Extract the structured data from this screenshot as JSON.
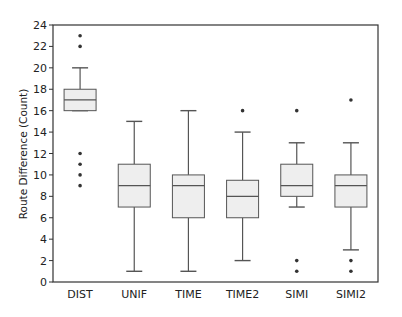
{
  "chart_data": {
    "type": "box",
    "title": "",
    "xlabel": "",
    "ylabel": "Route Difference (Count)",
    "ylim": [
      0,
      24
    ],
    "yticks": [
      0,
      2,
      4,
      6,
      8,
      10,
      12,
      14,
      16,
      18,
      20,
      22,
      24
    ],
    "grid": false,
    "legend": null,
    "categories": [
      "DIST",
      "UNIF",
      "TIME",
      "TIME2",
      "SIMI",
      "SIMI2"
    ],
    "boxes": [
      {
        "name": "DIST",
        "whisker_low": 16,
        "q1": 16,
        "median": 17,
        "q3": 18,
        "whisker_high": 20,
        "outliers": [
          23,
          22,
          12,
          11,
          10,
          9
        ]
      },
      {
        "name": "UNIF",
        "whisker_low": 1,
        "q1": 7,
        "median": 9,
        "q3": 11,
        "whisker_high": 15,
        "outliers": []
      },
      {
        "name": "TIME",
        "whisker_low": 1,
        "q1": 6,
        "median": 9,
        "q3": 10,
        "whisker_high": 16,
        "outliers": []
      },
      {
        "name": "TIME2",
        "whisker_low": 2,
        "q1": 6,
        "median": 8,
        "q3": 9.5,
        "whisker_high": 14,
        "outliers": [
          16
        ]
      },
      {
        "name": "SIMI",
        "whisker_low": 7,
        "q1": 8,
        "median": 9,
        "q3": 11,
        "whisker_high": 13,
        "outliers": [
          16,
          2,
          1
        ]
      },
      {
        "name": "SIMI2",
        "whisker_low": 3,
        "q1": 7,
        "median": 9,
        "q3": 10,
        "whisker_high": 13,
        "outliers": [
          17,
          2,
          1
        ]
      }
    ],
    "colors": {
      "box_fill": "#eeeeee",
      "box_edge": "#555555",
      "median": "#555555",
      "whisker": "#555555",
      "outlier": "#333333",
      "axis": "#333333"
    }
  }
}
